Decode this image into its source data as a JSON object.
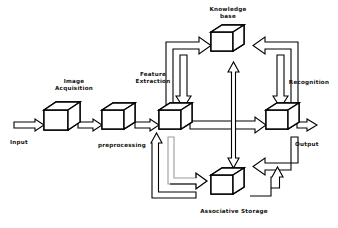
{
  "diagram": {
    "style": {
      "stroke": "#000000",
      "fill": "#ffffff",
      "faint_stroke": "#b8b8b8",
      "background": "#ffffff"
    },
    "nodes": [
      {
        "id": "image-acquisition",
        "label": "Image\nAcquisition",
        "shape": "cube",
        "label_position": "above"
      },
      {
        "id": "preprocessing",
        "label": "preprocessing",
        "shape": "cube",
        "label_position": "below"
      },
      {
        "id": "feature-extraction",
        "label": "Feature\nExtraction",
        "shape": "cube",
        "label_position": "above-left"
      },
      {
        "id": "knowledge-base",
        "label": "Knowledge\nbase",
        "shape": "cube",
        "label_position": "above"
      },
      {
        "id": "recognition",
        "label": "Recognition",
        "shape": "cube",
        "label_position": "above-right"
      },
      {
        "id": "associative-storage",
        "label": "Associative Storage",
        "shape": "cube",
        "label_position": "below"
      }
    ],
    "terminals": [
      {
        "id": "input",
        "label": "Input"
      },
      {
        "id": "output",
        "label": "Output"
      }
    ],
    "edges": [
      {
        "from": "input",
        "to": "image-acquisition",
        "kind": "block-arrow",
        "direction": "right"
      },
      {
        "from": "image-acquisition",
        "to": "preprocessing",
        "kind": "block-arrow",
        "direction": "right"
      },
      {
        "from": "preprocessing",
        "to": "feature-extraction",
        "kind": "block-arrow",
        "direction": "right"
      },
      {
        "from": "feature-extraction",
        "to": "recognition",
        "kind": "block-arrow",
        "direction": "right"
      },
      {
        "from": "recognition",
        "to": "output",
        "kind": "block-arrow",
        "direction": "right"
      },
      {
        "from": "feature-extraction",
        "to": "knowledge-base",
        "kind": "block-arrow",
        "direction": "up-right"
      },
      {
        "from": "knowledge-base",
        "to": "feature-extraction",
        "kind": "block-arrow",
        "direction": "down"
      },
      {
        "from": "knowledge-base",
        "to": "recognition",
        "kind": "block-arrow",
        "direction": "down-right"
      },
      {
        "from": "recognition",
        "to": "knowledge-base",
        "kind": "block-arrow",
        "direction": "up-left"
      },
      {
        "from": "knowledge-base",
        "to": "associative-storage",
        "kind": "block-arrow-double",
        "direction": "vertical"
      },
      {
        "from": "feature-extraction",
        "to": "associative-storage",
        "kind": "block-arrow",
        "direction": "down-right"
      },
      {
        "from": "associative-storage",
        "to": "feature-extraction",
        "kind": "block-arrow",
        "direction": "up-left"
      },
      {
        "from": "recognition",
        "to": "associative-storage",
        "kind": "block-arrow",
        "direction": "down-left"
      },
      {
        "from": "associative-storage",
        "to": "recognition",
        "kind": "block-arrow",
        "direction": "up-right"
      }
    ]
  },
  "labels": {
    "image_acquisition_l1": "Image",
    "image_acquisition_l2": "Acquisition",
    "preprocessing": "preprocessing",
    "feature_extraction_l1": "Feature",
    "feature_extraction_l2": "Extraction",
    "knowledge_base_l1": "Knowledge",
    "knowledge_base_l2": "base",
    "recognition": "Recognition",
    "associative_storage": "Associative Storage",
    "input": "Input",
    "output": "Output"
  }
}
